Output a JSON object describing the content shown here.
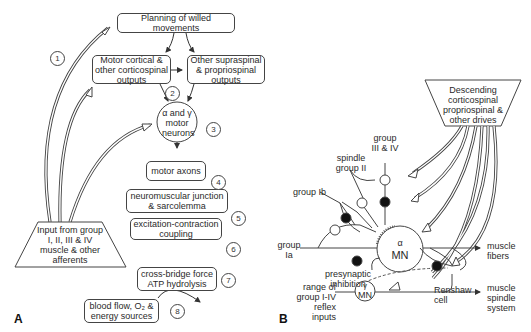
{
  "panelA": {
    "label": "A",
    "boxes": {
      "planning": "Planning of willed movements",
      "motor_cortical": "Motor cortical & other corticospinal outputs",
      "other_supraspinal": "Other supraspinal & propriospinal outputs",
      "motor_neurons": "α and γ motor neurons",
      "motor_axons": "motor axons",
      "nmj": "neuromuscular junction & sarcolemma",
      "ec_coupling": "excitation-contraction coupling",
      "cross_bridge": "cross-bridge force ATP hydrolysis",
      "blood_flow": "blood flow, O₂ & energy sources",
      "input": "Input from group I, II, III & IV muscle & other afferents"
    },
    "numbers": [
      "1",
      "2",
      "3",
      "4",
      "5",
      "6",
      "7",
      "8"
    ]
  },
  "panelB": {
    "label": "B",
    "descending": "Descending corticospinal propriospinal & other drives",
    "labels": {
      "group_iii_iv": "group III & IV",
      "spindle_group_ii": "spindle group II",
      "group_ib": "group Ib",
      "group_ia": "group Ia",
      "presynaptic": "presynaptic inhibition",
      "alpha_mn_symbol": "α",
      "alpha_mn": "MN",
      "gamma_mn_symbol": "γ",
      "gamma_mn": "MN",
      "muscle_fibers": "muscle fibers",
      "renshaw": "Renshaw cell",
      "range_inputs": "range of group I-IV reflex inputs",
      "muscle_spindle": "muscle spindle system"
    }
  }
}
